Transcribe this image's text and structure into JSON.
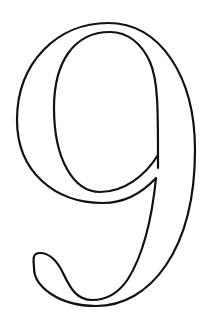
{
  "figure": {
    "glyph": "9",
    "style": "outlined serif numeral",
    "stroke_color": "#111111",
    "background_color": "#ffffff"
  }
}
